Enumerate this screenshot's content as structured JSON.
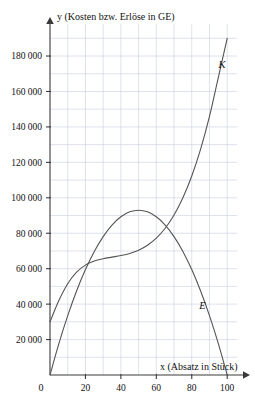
{
  "chart_data": {
    "type": "line",
    "title": "",
    "xlabel": "x (Absatz in Stück)",
    "ylabel": "y (Kosten bzw. Erlöse in GE)",
    "xlim": [
      0,
      105
    ],
    "ylim": [
      0,
      192000
    ],
    "grid": true,
    "grid_step_x": 10,
    "grid_step_y": 10000,
    "legend": "inline-curve-labels",
    "origin_label": "0",
    "xticks": [
      0,
      20,
      40,
      60,
      80,
      100
    ],
    "xtick_labels": [
      "0",
      "20",
      "40",
      "60",
      "80",
      "100"
    ],
    "yticks": [
      20000,
      40000,
      60000,
      80000,
      100000,
      120000,
      140000,
      160000,
      180000
    ],
    "ytick_labels": [
      "20 000",
      "40 000",
      "60 000",
      "80 000",
      "100 000",
      "120 000",
      "140 000",
      "160 000",
      "180 000"
    ],
    "series": [
      {
        "name": "K",
        "label": "K",
        "description": "Kostenfunktion",
        "color": "#555555",
        "label_x": 97,
        "label_y": 173000,
        "x": [
          0,
          5,
          10,
          15,
          20,
          25,
          30,
          35,
          40,
          45,
          50,
          55,
          60,
          65,
          70,
          75,
          80,
          85,
          90,
          95,
          100
        ],
        "values": [
          30000,
          42000,
          51500,
          58000,
          62000,
          64300,
          65600,
          66500,
          67400,
          68600,
          70400,
          73200,
          77200,
          82800,
          90300,
          100000,
          112300,
          127500,
          146000,
          168000,
          190000
        ]
      },
      {
        "name": "E",
        "label": "E",
        "description": "Erlösfunktion",
        "color": "#555555",
        "label_x": 86,
        "label_y": 37000,
        "x": [
          0,
          5,
          10,
          15,
          20,
          25,
          30,
          35,
          40,
          45,
          50,
          55,
          60,
          65,
          70,
          75,
          80,
          85,
          90,
          95,
          100
        ],
        "values": [
          0,
          17670,
          33480,
          47430,
          59520,
          69750,
          78120,
          84630,
          89280,
          92070,
          93000,
          92070,
          89280,
          84630,
          78120,
          69750,
          59520,
          47430,
          33480,
          17670,
          0
        ]
      }
    ],
    "intersections": [
      {
        "x": 20,
        "y": 62000
      },
      {
        "x": 72,
        "y": 85000
      }
    ]
  },
  "axes": {
    "x_arrow": true,
    "y_arrow": true,
    "axis_color": "#3a3a3a",
    "grid_color": "#c8cfe0"
  }
}
